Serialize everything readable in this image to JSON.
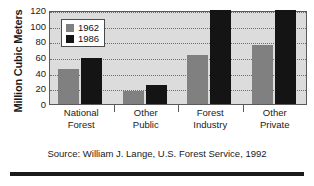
{
  "chart_data": {
    "type": "bar",
    "title": "",
    "xlabel": "",
    "ylabel": "Million Cubic Meters",
    "categories": [
      "National Forest",
      "Other Public",
      "Forest Industry",
      "Other Private"
    ],
    "category_lines": [
      [
        "National",
        "Forest"
      ],
      [
        "Other",
        "Public"
      ],
      [
        "Forest",
        "Industry"
      ],
      [
        "Other",
        "Private"
      ]
    ],
    "series": [
      {
        "name": "1962",
        "color": "#808080",
        "values": [
          45,
          16,
          62,
          75
        ]
      },
      {
        "name": "1986",
        "color": "#141414",
        "values": [
          59,
          24,
          120,
          120
        ]
      }
    ],
    "ylim": [
      0,
      120
    ],
    "yticks": [
      0,
      20,
      40,
      60,
      80,
      100,
      120
    ],
    "ytick_labels": [
      "0",
      "20",
      "40",
      "60",
      "80",
      "100",
      "120"
    ],
    "grid": true,
    "grid_style": "dotted-horizontal",
    "legend_position": "upper-left-inside",
    "plot_background": "#dcdcdc"
  },
  "legend": {
    "entries": [
      {
        "label": "1962",
        "swatch": "gray-swatch"
      },
      {
        "label": "1986",
        "swatch": "black-swatch"
      }
    ]
  },
  "caption": {
    "source": "Source: William J. Lange, U.S. Forest Service, 1992"
  }
}
